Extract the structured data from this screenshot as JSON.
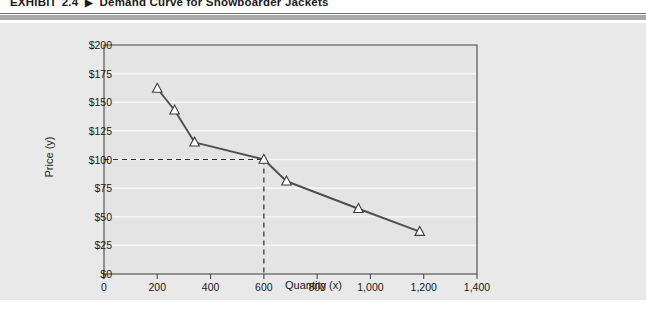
{
  "exhibit": {
    "label": "EXHIBIT",
    "number": "2.4",
    "arrow": "▶",
    "caption": "Demand Curve for Snowboarder Jackets"
  },
  "colors": {
    "panel_background": "#e9e9e9",
    "plot_background": "#e4e4e4",
    "gridline": "#f7f7f7",
    "axis": "#4a4a4a",
    "series_line": "#4f4f4f",
    "marker_fill": "#ffffff",
    "marker_stroke": "#3c3c3c",
    "reference_line": "#2b2b2b",
    "rule_thin": "#6e6e6e",
    "rule_thick": "#a8a8a8"
  },
  "chart_data": {
    "type": "line",
    "title": "Demand Curve for Snowboarder Jackets",
    "xlabel": "Quantity (x)",
    "ylabel": "Price (y)",
    "xlim": [
      0,
      1400
    ],
    "ylim": [
      0,
      200
    ],
    "xticks": [
      0,
      200,
      400,
      600,
      800,
      1000,
      1200,
      1400
    ],
    "xtick_labels": [
      "0",
      "200",
      "400",
      "600",
      "800",
      "1,000",
      "1,200",
      "1,400"
    ],
    "yticks": [
      0,
      25,
      50,
      75,
      100,
      125,
      150,
      175,
      200
    ],
    "ytick_labels": [
      "$0",
      "$25",
      "$50",
      "$75",
      "$100",
      "$125",
      "$150",
      "$175",
      "$200"
    ],
    "grid": "horizontal",
    "legend": null,
    "marker": "triangle",
    "series": [
      {
        "name": "Demand",
        "x": [
          200,
          265,
          340,
          600,
          685,
          955,
          1185
        ],
        "y": [
          162,
          143,
          115,
          100,
          81,
          57,
          37
        ]
      }
    ],
    "annotations": [
      {
        "type": "reference-lines",
        "x": 600,
        "y": 100,
        "style": "dashed",
        "description": "Dashed guide lines from the y-axis at $100 and from the x-axis at 600 meeting at the demand curve point (600, $100)"
      }
    ]
  }
}
